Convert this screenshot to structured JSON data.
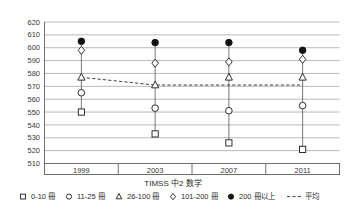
{
  "chart_data": {
    "type": "line",
    "title": "",
    "xlabel": "TIMSS 中2 数学",
    "ylabel": "",
    "categories": [
      "1999",
      "2003",
      "2007",
      "2011"
    ],
    "ylim": [
      510,
      620
    ],
    "ytick_step": 10,
    "yticks": [
      620,
      610,
      600,
      590,
      580,
      570,
      560,
      550,
      540,
      530,
      520,
      510
    ],
    "grid": true,
    "legend_position": "bottom",
    "series": [
      {
        "name": "0-10 冊",
        "marker": "open-square",
        "values": [
          550,
          533,
          526,
          521
        ]
      },
      {
        "name": "11-25 冊",
        "marker": "open-circle",
        "values": [
          565,
          553,
          551,
          555
        ]
      },
      {
        "name": "26-100 冊",
        "marker": "open-triangle",
        "values": [
          577,
          571,
          577,
          577
        ]
      },
      {
        "name": "101-200 冊",
        "marker": "open-diamond",
        "values": [
          598,
          588,
          589,
          591
        ]
      },
      {
        "name": "200 冊以上",
        "marker": "filled-circle",
        "values": [
          605,
          604,
          604,
          598
        ]
      },
      {
        "name": "平均",
        "marker": "dashed-line",
        "values": [
          577,
          571,
          571,
          571
        ]
      }
    ]
  },
  "axis": {
    "ytick_labels": [
      "620",
      "610",
      "600",
      "590",
      "580",
      "570",
      "560",
      "550",
      "540",
      "530",
      "520",
      "510"
    ],
    "xtick_labels": [
      "1999",
      "2003",
      "2007",
      "2011"
    ],
    "x_axis_title": "TIMSS 中2 数学"
  },
  "legend": {
    "entries": [
      {
        "label": "0-10 冊",
        "marker": "open-square"
      },
      {
        "label": "11-25 冊",
        "marker": "open-circle"
      },
      {
        "label": "26-100 冊",
        "marker": "open-triangle"
      },
      {
        "label": "101-200 冊",
        "marker": "open-diamond"
      },
      {
        "label": "200 冊以上",
        "marker": "filled-circle"
      },
      {
        "label": "平均",
        "marker": "dashed-line"
      }
    ]
  },
  "colors": {
    "background": "#ffffff",
    "gridline": "#8a8a8a",
    "axis": "#4a4a4a",
    "marker_stroke": "#1a1a1a",
    "marker_fill_open": "#ffffff",
    "marker_fill_solid": "#111111",
    "text": "#2b2b2b"
  }
}
